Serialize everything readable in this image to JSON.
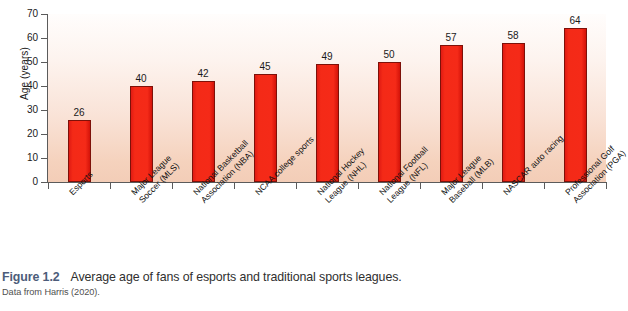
{
  "chart_data": {
    "type": "bar",
    "title": "",
    "xlabel": "",
    "ylabel": "Age (years)",
    "ylim": [
      0,
      70
    ],
    "yticks": [
      0,
      10,
      20,
      30,
      40,
      50,
      60,
      70
    ],
    "grid": false,
    "legend": null,
    "bar_color": "#f42a17",
    "bar_edge_color": "#7d1109",
    "plot_background": "vertical gradient white to #f3cdb7",
    "categories": [
      "Esports",
      "Major League Soccer (MLS)",
      "National Basketball Association (NBA)",
      "NCAA college sports",
      "National Hockey League (NHL)",
      "National Football League (NFL)",
      "Major League Baseball (MLB)",
      "NASCAR auto racing",
      "Professional Golf Association (PGA)"
    ],
    "category_lines": [
      [
        "Esports"
      ],
      [
        "Major League",
        "Soccer (MLS)"
      ],
      [
        "National Basketball",
        "Association (NBA)"
      ],
      [
        "NCAA college sports"
      ],
      [
        "National Hockey",
        "League (NHL)"
      ],
      [
        "National Football",
        "League (NFL)"
      ],
      [
        "Major League",
        "Baseball (MLB)"
      ],
      [
        "NASCAR auto racing"
      ],
      [
        "Professional Golf",
        "Association (PGA)"
      ]
    ],
    "values": [
      26,
      40,
      42,
      45,
      49,
      50,
      57,
      58,
      64
    ]
  },
  "caption": {
    "figure_number": "Figure 1.2",
    "text": "Average age of fans of esports and traditional sports leagues.",
    "source": "Data from Harris (2020)."
  }
}
